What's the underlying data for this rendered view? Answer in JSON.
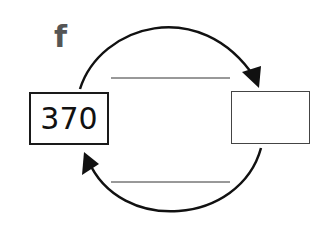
{
  "label": "f",
  "input_value": "370",
  "output_value": "",
  "top_blank": "",
  "bottom_blank": ""
}
